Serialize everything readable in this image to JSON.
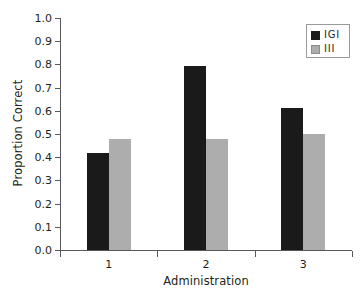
{
  "chart_data": {
    "type": "bar",
    "title": "",
    "subtitle": "",
    "xlabel": "Administration",
    "ylabel": "Proportion Correct",
    "categories": [
      "1",
      "2",
      "3"
    ],
    "series": [
      {
        "name": "IGI",
        "values": [
          0.42,
          0.795,
          0.61
        ],
        "color": "#1a1a1a"
      },
      {
        "name": "III",
        "values": [
          0.48,
          0.48,
          0.5
        ],
        "color": "#adadad"
      }
    ],
    "ylim": [
      0.0,
      1.0
    ],
    "ytick_step": 0.1,
    "ytick_labels": [
      "0.0",
      "0.1",
      "0.2",
      "0.3",
      "0.4",
      "0.5",
      "0.6",
      "0.7",
      "0.8",
      "0.9",
      "1.0"
    ],
    "grid": false,
    "legend_position": "top-right",
    "orientation": "vertical",
    "grouped": true
  }
}
